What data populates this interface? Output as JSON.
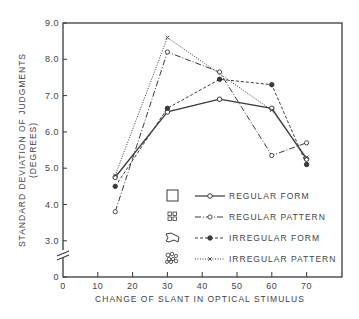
{
  "chart_data": {
    "type": "line",
    "title": "",
    "xlabel": "CHANGE OF SLANT IN OPTICAL STIMULUS",
    "ylabel_line1": "STANDARD DEVIATION OF JUDGMENTS",
    "ylabel_line2": "(DEGREES)",
    "xlim": [
      0,
      80
    ],
    "ylim": [
      0,
      9.0
    ],
    "y_axis_break": true,
    "x_ticks": [
      0,
      10,
      20,
      30,
      40,
      50,
      60,
      70
    ],
    "x_tick_labels": [
      "0",
      "10",
      "20",
      "30",
      "40",
      "50",
      "60",
      "70"
    ],
    "y_ticks": [
      0,
      3.0,
      4.0,
      5.0,
      6.0,
      7.0,
      8.0,
      9.0
    ],
    "y_tick_labels": [
      "0",
      "3.0",
      "4.0",
      "5.0",
      "6.0",
      "7.0",
      "8.0",
      "9.0"
    ],
    "grid": false,
    "legend_position": "lower right inside",
    "series": [
      {
        "name": "REGULAR FORM",
        "line_style": "solid",
        "marker": "open-circle",
        "legend_icon": "square-icon",
        "x": [
          15,
          30,
          45,
          60,
          70
        ],
        "values": [
          4.75,
          6.55,
          6.9,
          6.65,
          5.25
        ]
      },
      {
        "name": "REGULAR PATTERN",
        "line_style": "dash-dot",
        "marker": "open-circle-small",
        "legend_icon": "four-squares-icon",
        "x": [
          15,
          30,
          45,
          60,
          70
        ],
        "values": [
          3.8,
          8.2,
          7.65,
          5.35,
          5.7
        ]
      },
      {
        "name": "IRREGULAR FORM",
        "line_style": "dashed",
        "marker": "filled-circle",
        "legend_icon": "irregular-blob-icon",
        "x": [
          15,
          30,
          45,
          60,
          70
        ],
        "values": [
          4.5,
          6.65,
          7.45,
          7.3,
          5.1
        ]
      },
      {
        "name": "IRREGULAR PATTERN",
        "line_style": "dotted",
        "marker": "x",
        "legend_icon": "irregular-cluster-icon",
        "x": [
          15,
          30,
          60,
          70
        ],
        "values": [
          4.8,
          8.6,
          6.6,
          5.3
        ]
      }
    ]
  },
  "colors": {
    "ink": "#3a3a3a",
    "text": "#444444",
    "background": "#ffffff"
  }
}
